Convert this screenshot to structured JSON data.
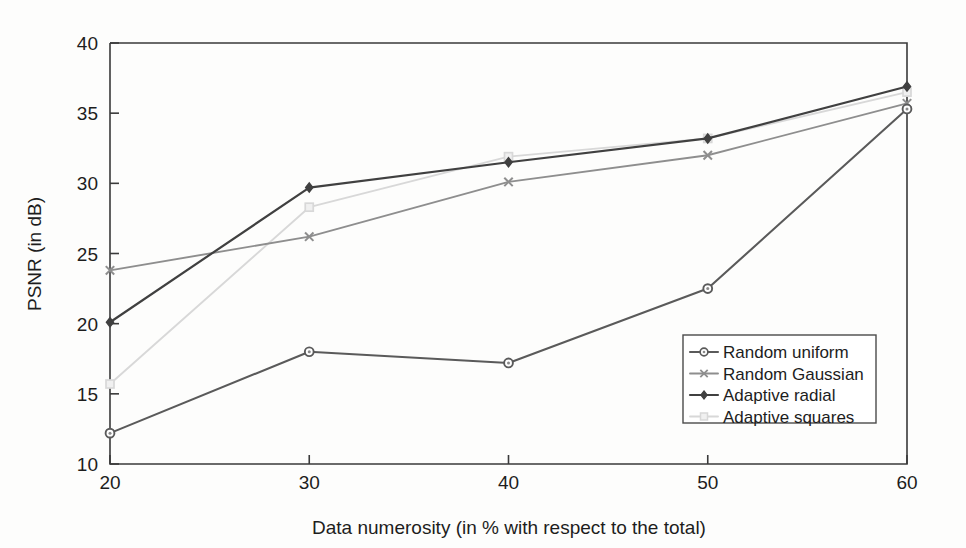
{
  "chart_data": {
    "type": "line",
    "title": "",
    "xlabel": "Data numerosity (in % with respect to the total)",
    "ylabel": "PSNR (in dB)",
    "x": [
      20,
      30,
      40,
      50,
      60
    ],
    "xticklabels": [
      "20",
      "30",
      "40",
      "50",
      "60"
    ],
    "yticks": [
      10,
      15,
      20,
      25,
      30,
      35,
      40
    ],
    "yticklabels": [
      "10",
      "15",
      "20",
      "25",
      "30",
      "35",
      "40"
    ],
    "xlim": [
      20,
      60
    ],
    "ylim": [
      10,
      40
    ],
    "grid": false,
    "legend_position": "lower right",
    "series": [
      {
        "name": "Random uniform",
        "values": [
          12.2,
          18.0,
          17.2,
          22.5,
          35.3
        ],
        "color": "#5a5a5a",
        "marker": "circle",
        "marker_fill": "#8a8a8a",
        "linewidth": 2.1
      },
      {
        "name": "Random Gaussian",
        "values": [
          23.8,
          26.2,
          30.1,
          32.0,
          35.7
        ],
        "color": "#8e8e8e",
        "marker": "x",
        "marker_fill": "#8e8e8e",
        "linewidth": 1.9
      },
      {
        "name": "Adaptive radial",
        "values": [
          20.1,
          29.7,
          31.5,
          33.2,
          36.9
        ],
        "color": "#404040",
        "marker": "diamond",
        "marker_fill": "#404040",
        "linewidth": 2.2
      },
      {
        "name": "Adaptive squares",
        "values": [
          15.7,
          28.3,
          31.9,
          33.2,
          36.5
        ],
        "color": "#d8d8d8",
        "marker": "square",
        "marker_fill": "#f0f0f0",
        "linewidth": 1.9
      }
    ]
  },
  "legend": {
    "entries": [
      {
        "label": "Random uniform"
      },
      {
        "label": "Random Gaussian"
      },
      {
        "label": "Adaptive radial"
      },
      {
        "label": "Adaptive squares"
      }
    ]
  },
  "axes": {
    "x_title": "Data numerosity (in % with respect to the total)",
    "y_title": "PSNR (in dB)"
  }
}
